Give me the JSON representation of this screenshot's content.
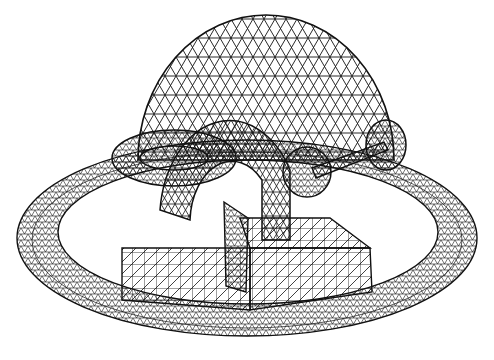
{
  "image": {
    "description": "Black-and-white triangulated wireframe render of a 3D scene",
    "background_color": "#ffffff",
    "line_color": "#111111",
    "objects": [
      {
        "name": "dome",
        "shape": "hemisphere"
      },
      {
        "name": "outer-ring",
        "shape": "flat annulus / ring"
      },
      {
        "name": "torus-small",
        "shape": "torus"
      },
      {
        "name": "torus-large",
        "shape": "half torus / arch"
      },
      {
        "name": "dumbbell",
        "shape": "two spheres joined by rod"
      },
      {
        "name": "block",
        "shape": "rectangular box"
      },
      {
        "name": "pyramid",
        "shape": "triangular prism/spike"
      }
    ]
  }
}
